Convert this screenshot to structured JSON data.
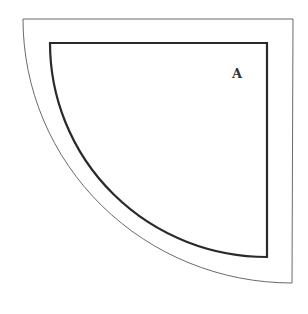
{
  "diagram": {
    "labels": {
      "inner_region": "A"
    },
    "shapes": [
      {
        "name": "outer-quarter-circle",
        "kind": "quarter-circle",
        "stroke_color": "#6a6a6a"
      },
      {
        "name": "inner-quarter-circle",
        "kind": "quarter-circle",
        "stroke_color": "#2a2a2a"
      }
    ]
  }
}
